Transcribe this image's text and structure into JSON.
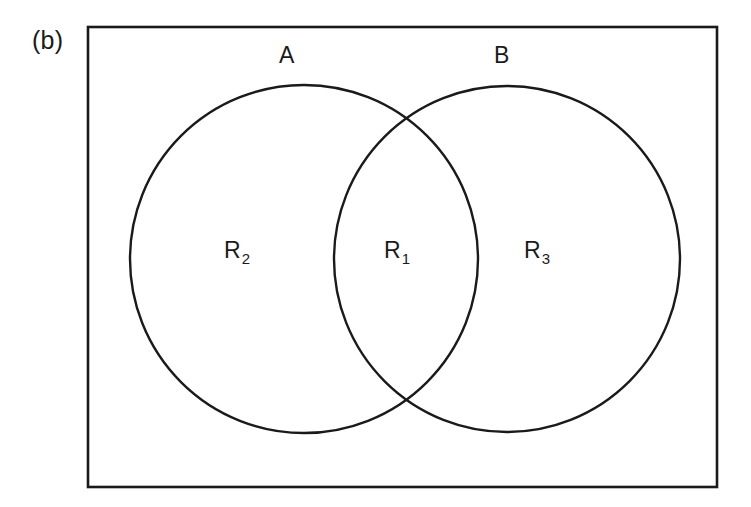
{
  "figure": {
    "panel_label": "(b)",
    "background_color": "#ffffff",
    "stroke_color": "#1a1a1a",
    "width": 751,
    "height": 507
  },
  "universe_rectangle": {
    "name": "universal-set-box",
    "x": 88,
    "y": 27,
    "width": 629,
    "height": 460,
    "stroke_width": 2.6
  },
  "sets": [
    {
      "label": "A",
      "name": "set-a",
      "cx": 304,
      "cy": 259,
      "r": 174,
      "stroke_width": 2.4
    },
    {
      "label": "B",
      "name": "set-b",
      "cx": 507,
      "cy": 259,
      "r": 173,
      "stroke_width": 2.4
    }
  ],
  "regions": [
    {
      "name": "region-r2",
      "base": "R",
      "subscript": "2",
      "text": "R2",
      "meaning": "A only",
      "x": 240,
      "y": 255
    },
    {
      "name": "region-r1",
      "base": "R",
      "subscript": "1",
      "text": "R1",
      "meaning": "A intersect B",
      "x": 400,
      "y": 255
    },
    {
      "name": "region-r3",
      "base": "R",
      "subscript": "3",
      "text": "R3",
      "meaning": "B only",
      "x": 545,
      "y": 255
    }
  ],
  "set_labels": [
    {
      "name": "label-set-a",
      "text": "A",
      "x": 287,
      "y": 58
    },
    {
      "name": "label-set-b",
      "text": "B",
      "x": 502,
      "y": 58
    }
  ],
  "intersection_points": [
    {
      "x": 405,
      "y": 122
    },
    {
      "x": 405,
      "y": 393
    }
  ]
}
